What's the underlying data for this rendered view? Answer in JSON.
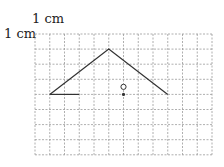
{
  "labels": {
    "top": "1 cm",
    "left": "1 cm"
  },
  "grid": {
    "x0": 35,
    "y0": 34,
    "cols": 12,
    "rows": 8,
    "cell_w": 14.75,
    "cell_h": 15.1,
    "color": "#9a9a9a"
  },
  "figure": {
    "polyline": [
      [
        1,
        4
      ],
      [
        5,
        1
      ],
      [
        9,
        4
      ]
    ],
    "segment": [
      [
        1,
        4
      ],
      [
        3,
        4
      ]
    ],
    "open_circle": [
      6,
      3.5
    ],
    "dot": [
      6,
      4
    ],
    "stroke": "#333333"
  }
}
